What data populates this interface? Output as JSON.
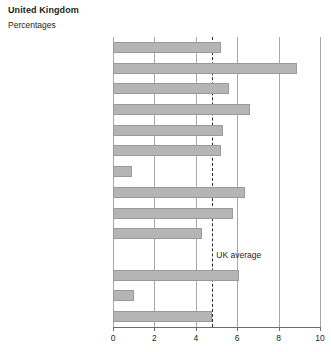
{
  "header": {
    "title": "United Kingdom",
    "subtitle": "Percentages"
  },
  "annotation": {
    "uk_average_label": "UK average"
  },
  "colors": {
    "bar_fill": "#b5b5b5",
    "bar_border": "#9a9a9a",
    "gridline": "#a8a8a8",
    "axis": "#6d6d6d",
    "average_line": "#2a2a2a",
    "text": "#231f20",
    "background": "#ffffff"
  },
  "chart_data": {
    "type": "bar",
    "orientation": "horizontal",
    "title": "United Kingdom",
    "subtitle": "Percentages",
    "xlabel": "",
    "ylabel": "",
    "xlim": [
      0,
      10
    ],
    "xticks": [
      0,
      2,
      4,
      6,
      8,
      10
    ],
    "xtick_labels": [
      "0",
      "2",
      "4",
      "6",
      "8",
      "10"
    ],
    "grid": "vertical",
    "legend": "none",
    "categories": [
      "England",
      "Northern",
      "North West",
      "Yorkshire and Humberside",
      "East Midlands",
      "West Midlands",
      "East Anglia",
      "Greater London",
      "South East",
      "South West",
      "Wales",
      "Scotland",
      "Northern Ireland"
    ],
    "category_footnotes": {
      "East Anglia": "3",
      "Greater London": "3",
      "Scotland": "4",
      "Northern Ireland": "3"
    },
    "values": [
      5.2,
      8.9,
      5.6,
      6.6,
      5.3,
      5.2,
      0.9,
      6.4,
      5.8,
      4.3,
      6.1,
      1.0,
      4.8
    ],
    "annotations": [
      {
        "type": "reference-line",
        "label": "UK average",
        "value": 4.8,
        "style": "dashed"
      }
    ],
    "gap_after_index": 9
  }
}
